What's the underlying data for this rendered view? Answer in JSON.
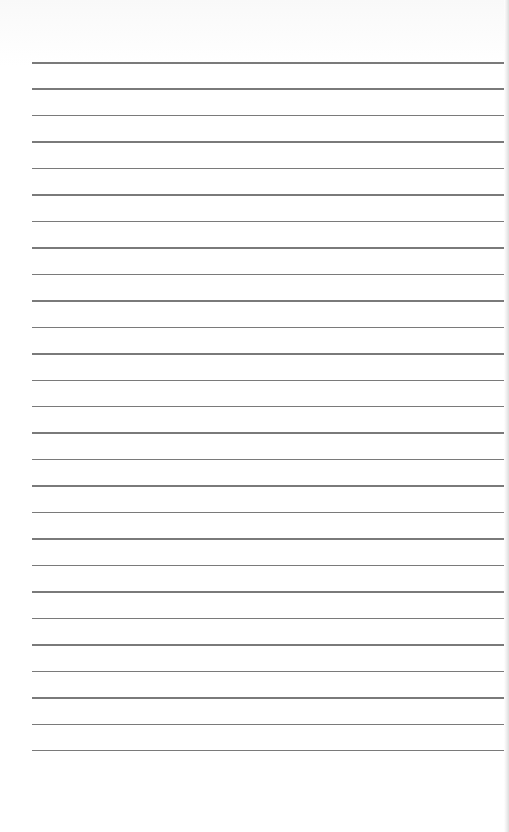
{
  "document": {
    "type": "lined-paper",
    "background_color": "#ffffff",
    "rule_color": "#7a7a7a",
    "rule_count": 27,
    "rule_left": 32,
    "first_rule_y": 62,
    "rule_spacing": 26.46
  }
}
